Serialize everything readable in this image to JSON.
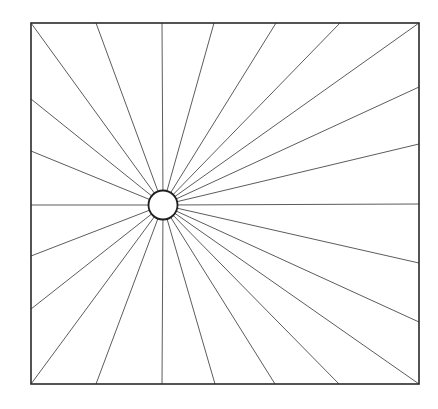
{
  "diagram": {
    "type": "radial-spokes-in-square",
    "square": {
      "left": 31,
      "top": 23,
      "right": 419,
      "bottom": 384
    },
    "hub": {
      "cx": 163,
      "cy": 205,
      "r": 14.5
    },
    "spoke_endpoints": [
      [
        31,
        23
      ],
      [
        96,
        23
      ],
      [
        162,
        23
      ],
      [
        214,
        23
      ],
      [
        276,
        23
      ],
      [
        340,
        23
      ],
      [
        419,
        23
      ],
      [
        419,
        87
      ],
      [
        419,
        144
      ],
      [
        419,
        204
      ],
      [
        419,
        263
      ],
      [
        419,
        322
      ],
      [
        419,
        384
      ],
      [
        339,
        384
      ],
      [
        275,
        384
      ],
      [
        215,
        384
      ],
      [
        162,
        384
      ],
      [
        96,
        384
      ],
      [
        31,
        384
      ],
      [
        31,
        309
      ],
      [
        31,
        256
      ],
      [
        31,
        205
      ],
      [
        31,
        151
      ],
      [
        31,
        99
      ]
    ],
    "colors": {
      "background": "#ffffff",
      "lines": "#2a2a2a"
    }
  }
}
